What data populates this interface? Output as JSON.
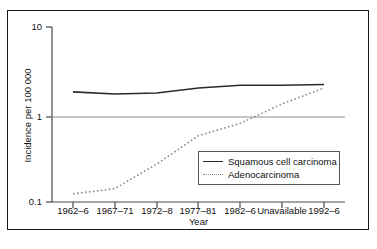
{
  "chart_data": {
    "type": "line",
    "title": "",
    "subtitle": "",
    "xlabel": "Year",
    "ylabel": "Incidence per 100 000",
    "yscale": "log",
    "ylim": [
      0.1,
      10
    ],
    "ytick_labels": [
      "10",
      "1",
      "0.1"
    ],
    "ytick_values": [
      10,
      1,
      0.1
    ],
    "grid": "horizontal-at-1",
    "legend_position": "bottom-right-inside",
    "categories": [
      "1962–6",
      "1967–71",
      "1972–8",
      "1977–81",
      "1982–6",
      "Unavailable",
      "1992–6"
    ],
    "series": [
      {
        "name": "Squamous cell carcinoma",
        "style": "solid",
        "color": "#2a2a2a",
        "values": [
          1.9,
          1.8,
          1.85,
          2.1,
          2.25,
          2.25,
          2.3
        ]
      },
      {
        "name": "Adenocarcinoma",
        "style": "dotted",
        "color": "#8d8d8d",
        "values": [
          0.14,
          0.16,
          0.3,
          0.62,
          0.85,
          1.4,
          2.1
        ]
      }
    ]
  },
  "legend": {
    "items": [
      {
        "label": "Squamous cell carcinoma"
      },
      {
        "label": "Adenocarcinoma"
      }
    ]
  },
  "axes": {
    "x_title": "Year",
    "y_title": "Incidence per 100 000"
  }
}
